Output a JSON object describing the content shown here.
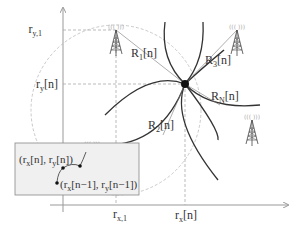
{
  "diagram": {
    "axes": {
      "y_labels": [
        {
          "main": "r",
          "sub": "y,1",
          "suffix": ""
        },
        {
          "main": "r",
          "sub": "y",
          "suffix": "[n]"
        }
      ],
      "x_labels": [
        {
          "main": "r",
          "sub": "x,1",
          "suffix": ""
        },
        {
          "main": "r",
          "sub": "x",
          "suffix": "[n]"
        }
      ]
    },
    "ranges": [
      {
        "main": "R",
        "sub": "1",
        "suffix": "[n]"
      },
      {
        "main": "R",
        "sub": "2",
        "suffix": "[n]"
      },
      {
        "main": "R",
        "sub": "3",
        "suffix": "[n]"
      },
      {
        "main": "R",
        "sub": "N",
        "suffix": "[n]"
      }
    ],
    "inset": {
      "current_point": {
        "p1": "(r",
        "s1": "x",
        "p2": "[n], r",
        "s2": "y",
        "p3": "[n])"
      },
      "previous_point": {
        "p1": "(r",
        "s1": "x",
        "p2": "[n−1], r",
        "s2": "y",
        "p3": "[n−1])"
      }
    },
    "towers": [
      "tower-1",
      "tower-2",
      "tower-3",
      "tower-N"
    ],
    "colors": {
      "axis": "#999999",
      "curve": "#333333",
      "dashed": "#aaaaaa",
      "inset_bg": "#f0f0f0",
      "inset_border": "#888888"
    }
  }
}
